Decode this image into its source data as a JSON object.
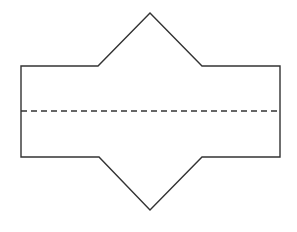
{
  "diagram": {
    "width": 297,
    "height": 232,
    "background": "#ffffff",
    "stroke_color": "#333333",
    "stroke_width": 1.4,
    "outline": {
      "description": "Rectangle with a triangular point on the top edge and a triangular point on the bottom edge (net / fold shape)",
      "points": [
        [
          21,
          66
        ],
        [
          98,
          66
        ],
        [
          150,
          13
        ],
        [
          202,
          66
        ],
        [
          280,
          66
        ],
        [
          280,
          157
        ],
        [
          202,
          157
        ],
        [
          150,
          210
        ],
        [
          99,
          157
        ],
        [
          21,
          157
        ]
      ]
    },
    "fold_line": {
      "style": "dashed",
      "dash": "6,4",
      "x1": 21,
      "y1": 111,
      "x2": 280,
      "y2": 111
    }
  }
}
